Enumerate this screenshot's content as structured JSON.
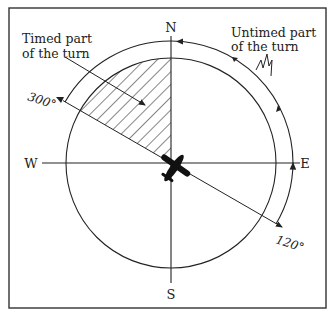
{
  "diagram": {
    "compass": {
      "north": "N",
      "south": "S",
      "east": "E",
      "west": "W"
    },
    "labels": {
      "timed": [
        "Timed part",
        "of the turn"
      ],
      "untimed": [
        "Untimed part",
        "of the turn"
      ],
      "heading_start": "300°",
      "heading_end": "120°"
    },
    "colors": {
      "ink": "#222222",
      "background": "#ffffff"
    }
  }
}
